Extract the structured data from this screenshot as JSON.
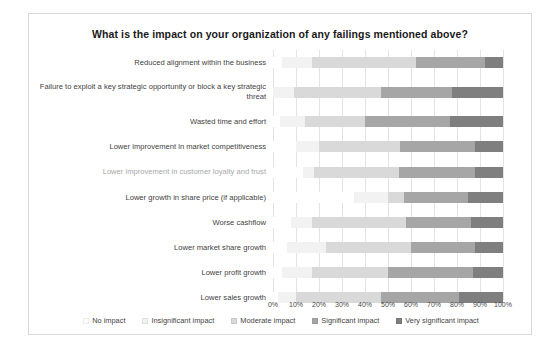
{
  "chart": {
    "title": "What is the impact on your organization of any failings mentioned above?"
  },
  "axis": {
    "ticks": [
      "0%",
      "10%",
      "20%",
      "30%",
      "40%",
      "50%",
      "60%",
      "70%",
      "80%",
      "90%",
      "100%"
    ]
  },
  "legend": [
    {
      "label": "No impact",
      "color": "#ffffff"
    },
    {
      "label": "Insignificant impact",
      "color": "#f2f2f2"
    },
    {
      "label": "Moderate impact",
      "color": "#d9d9d9"
    },
    {
      "label": "Significant impact",
      "color": "#a6a6a6"
    },
    {
      "label": "Very significant impact",
      "color": "#7f7f7f"
    }
  ],
  "chart_data": {
    "type": "bar",
    "subtype": "stacked-horizontal-100pct",
    "title": "What is the impact on your organization of any failings mentioned above?",
    "xlabel": "",
    "ylabel": "",
    "xlim": [
      0,
      100
    ],
    "grid": true,
    "legend_position": "bottom",
    "categories": [
      "Reduced alignment within the business",
      "Failure to exploit a key strategic opportunity or block a key strategic threat",
      "Wasted time and effort",
      "Lower improvement in market competitiveness",
      "Lower improvement in customer loyalty and trust",
      "Lower growth in share price (if applicable)",
      "Worse cashflow",
      "Lower market share growth",
      "Lower profit growth",
      "Lower sales growth"
    ],
    "series": [
      {
        "name": "No impact",
        "color": "#ffffff",
        "values": [
          4,
          0,
          3,
          10,
          13,
          35,
          8,
          6,
          4,
          2
        ]
      },
      {
        "name": "Insignificant impact",
        "color": "#f2f2f2",
        "values": [
          13,
          9,
          11,
          10,
          5,
          15,
          9,
          17,
          13,
          8
        ]
      },
      {
        "name": "Moderate impact",
        "color": "#d9d9d9",
        "values": [
          45,
          38,
          26,
          35,
          37,
          7,
          41,
          37,
          33,
          37
        ]
      },
      {
        "name": "Significant impact",
        "color": "#a6a6a6",
        "values": [
          30,
          31,
          37,
          33,
          33,
          28,
          28,
          28,
          37,
          34
        ]
      },
      {
        "name": "Very significant impact",
        "color": "#7f7f7f",
        "values": [
          8,
          22,
          23,
          12,
          12,
          15,
          14,
          12,
          13,
          19
        ]
      }
    ]
  }
}
